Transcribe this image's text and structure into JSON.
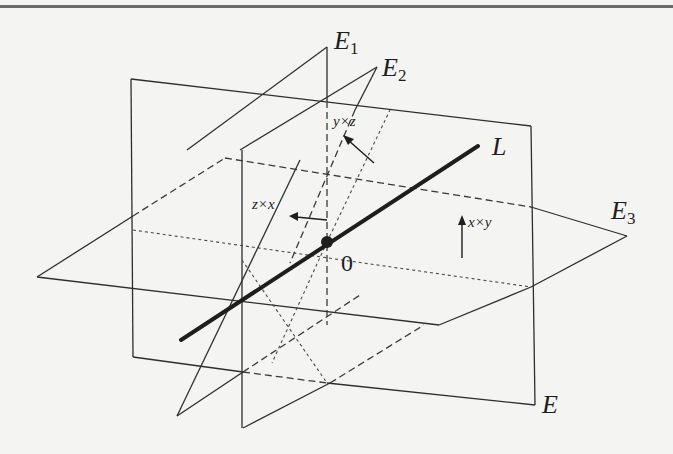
{
  "figure": {
    "type": "3D planes and line diagram",
    "planes": [
      {
        "id": "E",
        "label": "E",
        "subscript": ""
      },
      {
        "id": "E1",
        "label": "E",
        "subscript": "1"
      },
      {
        "id": "E2",
        "label": "E",
        "subscript": "2"
      },
      {
        "id": "E3",
        "label": "E",
        "subscript": "3"
      }
    ],
    "line": {
      "label": "L"
    },
    "origin": {
      "label": "0"
    },
    "vectors": [
      {
        "label": "y×z"
      },
      {
        "label": "z×x"
      },
      {
        "label": "x×y"
      }
    ]
  },
  "colors": {
    "background": "#f4f4f2",
    "ink": "#1e1e1e",
    "rule": "#6a6a6a"
  }
}
